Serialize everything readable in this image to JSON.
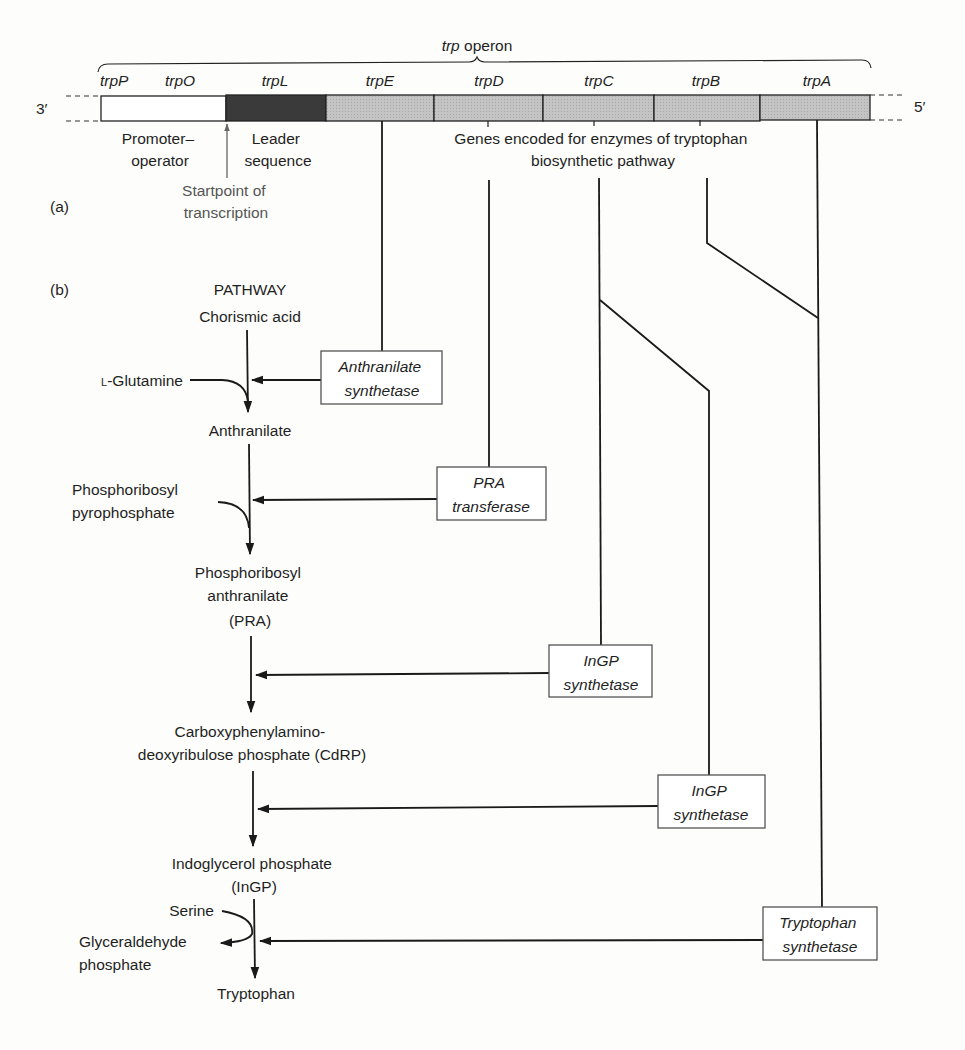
{
  "operon": {
    "title_italic": "trp",
    "title_rest": " operon",
    "end_left": "3′",
    "end_right": "5′",
    "colors": {
      "promoter": "#ffffff",
      "leader": "#3a3a3a",
      "gene": "#bdbdbd",
      "outline": "#222222"
    },
    "segments": [
      {
        "id": "promoter-operator",
        "labels": [
          "trpP",
          "trpO"
        ],
        "kind": "promoter"
      },
      {
        "id": "leader",
        "labels": [
          "trpL"
        ],
        "kind": "leader"
      },
      {
        "id": "trpE",
        "labels": [
          "trpE"
        ],
        "kind": "gene"
      },
      {
        "id": "trpD",
        "labels": [
          "trpD"
        ],
        "kind": "gene"
      },
      {
        "id": "trpC",
        "labels": [
          "trpC"
        ],
        "kind": "gene"
      },
      {
        "id": "trpB",
        "labels": [
          "trpB"
        ],
        "kind": "gene"
      },
      {
        "id": "trpA",
        "labels": [
          "trpA"
        ],
        "kind": "gene"
      }
    ],
    "captions": {
      "promoter_operator": [
        "Promoter–",
        "operator"
      ],
      "leader_sequence": [
        "Leader",
        "sequence"
      ],
      "startpoint": [
        "Startpoint of",
        "transcription"
      ],
      "genes_encoded": [
        "Genes encoded for enzymes of tryptophan",
        "biosynthetic pathway"
      ]
    }
  },
  "panel_labels": {
    "a": "(a)",
    "b": "(b)"
  },
  "pathway": {
    "heading": "PATHWAY",
    "metabolites": [
      {
        "id": "chorismic-acid",
        "lines": [
          "Chorismic acid"
        ]
      },
      {
        "id": "anthranilate",
        "lines": [
          "Anthranilate"
        ]
      },
      {
        "id": "pra",
        "lines": [
          "Phosphoribosyl",
          "anthranilate",
          "(PRA)"
        ]
      },
      {
        "id": "cdrp",
        "lines": [
          "Carboxyphenylamino-",
          "deoxyribulose phosphate (CdRP)"
        ]
      },
      {
        "id": "ingp",
        "lines": [
          "Indoglycerol phosphate",
          "(InGP)"
        ]
      },
      {
        "id": "tryptophan",
        "lines": [
          "Tryptophan"
        ]
      }
    ],
    "cosubstrates": {
      "glutamine": {
        "prefix": "L",
        "rest": "-Glutamine"
      },
      "prpp": [
        "Phosphoribosyl",
        "pyrophosphate"
      ],
      "serine": "Serine",
      "g3p": [
        "Glyceraldehyde",
        "phosphate"
      ]
    },
    "enzymes": [
      {
        "id": "anthranilate-synthetase",
        "lines": [
          "Anthranilate",
          "synthetase"
        ],
        "genes": [
          "trpE"
        ]
      },
      {
        "id": "pra-transferase",
        "lines": [
          "PRA",
          "transferase"
        ],
        "genes": [
          "trpD"
        ]
      },
      {
        "id": "ingp-synthetase-1",
        "lines": [
          "InGP",
          "synthetase"
        ],
        "genes": [
          "trpC"
        ]
      },
      {
        "id": "ingp-synthetase-2",
        "lines": [
          "InGP",
          "synthetase"
        ],
        "genes": [
          "trpC"
        ]
      },
      {
        "id": "tryptophan-synthetase",
        "lines": [
          "Tryptophan",
          "synthetase"
        ],
        "genes": [
          "trpB",
          "trpA"
        ]
      }
    ]
  }
}
